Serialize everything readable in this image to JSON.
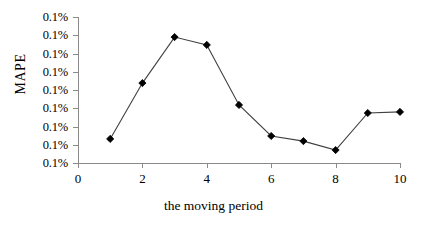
{
  "chart_data": {
    "type": "line",
    "title": "",
    "xlabel": "the moving period",
    "ylabel": "MAPE",
    "x": [
      1,
      2,
      3,
      4,
      5,
      6,
      7,
      8,
      9,
      10
    ],
    "values": [
      1.32,
      4.38,
      6.9,
      6.47,
      3.18,
      1.48,
      1.2,
      0.71,
      2.74,
      2.8
    ],
    "series": [
      {
        "name": "MAPE",
        "values": [
          1.32,
          4.38,
          6.9,
          6.47,
          3.18,
          1.48,
          1.2,
          0.71,
          2.74,
          2.8
        ]
      }
    ],
    "xlim": [
      0,
      10
    ],
    "ylim": [
      0,
      8
    ],
    "xticks": [
      0,
      2,
      4,
      6,
      8,
      10
    ],
    "xtick_labels": [
      "0",
      "2",
      "4",
      "6",
      "8",
      "10"
    ],
    "ytick_values": [
      0,
      1,
      2,
      3,
      4,
      5,
      6,
      7,
      8
    ],
    "ytick_labels": [
      "0.1%",
      "0.1%",
      "0.1%",
      "0.1%",
      "0.1%",
      "0.1%",
      "0.1%",
      "0.1%",
      "0.1%"
    ],
    "grid": false,
    "legend": false,
    "legend_position": "none",
    "marker": "diamond",
    "marker_color": "#000000",
    "line_color": "#404040",
    "axis_color": "#8a8a8a",
    "background_color": "#ffffff"
  }
}
